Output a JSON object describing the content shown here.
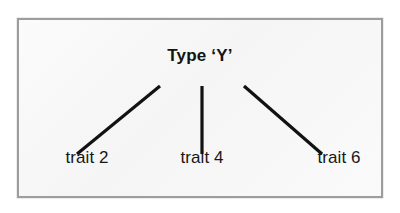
{
  "figure": {
    "type": "hierarchy-diagram",
    "root": {
      "label": "Type ‘Y’"
    },
    "leaves": [
      {
        "label": "trait 2"
      },
      {
        "label": "trait 4"
      },
      {
        "label": "trait 6"
      }
    ],
    "colors": {
      "line": "#121212",
      "border": "#9d9d9d",
      "panel_background": "#f8f8f8",
      "page_background": "#ffffff",
      "text": "#131313"
    },
    "edges": [
      {
        "from": "root",
        "to": "trait 2",
        "x1": 141,
        "y1": 66,
        "x2": 58,
        "y2": 134
      },
      {
        "from": "root",
        "to": "trait 4",
        "x1": 183,
        "y1": 66,
        "x2": 183,
        "y2": 134
      },
      {
        "from": "root",
        "to": "trait 6",
        "x1": 225,
        "y1": 66,
        "x2": 303,
        "y2": 134
      }
    ]
  }
}
